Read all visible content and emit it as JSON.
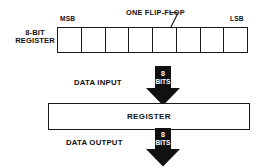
{
  "diagram": {
    "title_hidden": "",
    "top_section": {
      "caption_line1": "8-BIT",
      "caption_line2": "REGISTER",
      "msb_label": "MSB",
      "lsb_label": "LSB",
      "flipflop_label": "ONE FLIP-FLOP",
      "bit_count": 8,
      "cells": [
        "",
        "",
        "",
        "",
        "",
        "",
        "",
        ""
      ],
      "callout_target_cell_index": 6
    },
    "input": {
      "label": "DATA INPUT",
      "arrow_width_value": "8",
      "arrow_width_unit": "BITS",
      "direction": "down"
    },
    "register": {
      "label": "REGISTER"
    },
    "output": {
      "label": "DATA OUTPUT",
      "arrow_width_value": "8",
      "arrow_width_unit": "BITS",
      "direction": "down"
    },
    "colors": {
      "ink": "#1a1a1a",
      "arrow_fill": "#111111",
      "arrow_text": "#ffffff",
      "background": "#ffffff"
    }
  }
}
